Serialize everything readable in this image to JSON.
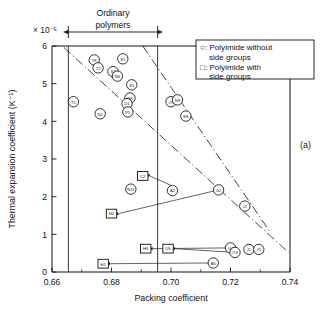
{
  "figure": {
    "panel_label": "(a)",
    "exponent_label": "× 10⁻⁵",
    "bracket_label_line1": "Ordinary",
    "bracket_label_line2": "polymers"
  },
  "legend": {
    "entries": [
      {
        "marker": "circle",
        "line1": "○: Polyimide without",
        "line2": "side groups"
      },
      {
        "marker": "square",
        "line1": "□: Polyimide with",
        "line2": "side groups"
      }
    ]
  },
  "chart_data": {
    "type": "scatter",
    "title": "",
    "xlabel": "Packing coefficient",
    "ylabel": "Thermal expansion coefficient (K⁻¹)",
    "y_exponent": "× 10⁻⁵",
    "xlim": [
      0.66,
      0.74
    ],
    "ylim": [
      0,
      6
    ],
    "xticks": [
      0.66,
      0.68,
      0.7,
      0.72,
      0.74
    ],
    "xtick_labels": [
      "0.66",
      "0.68",
      "0.70",
      "0.72",
      "0.74"
    ],
    "x_minor_ticks": [
      0.67,
      0.69,
      0.71,
      0.73
    ],
    "yticks": [
      0,
      1,
      2,
      3,
      4,
      5,
      6
    ],
    "ytick_labels": [
      "0",
      "1",
      "2",
      "3",
      "4",
      "5",
      "6"
    ],
    "grid": false,
    "legend_position": "top-right",
    "vertical_reference_lines": [
      0.6655,
      0.6955
    ],
    "annotation_bracket": {
      "label": "Ordinary polymers",
      "x_start": 0.6655,
      "x_end": 0.6955
    },
    "series": [
      {
        "name": "Polyimide without side groups",
        "marker": "circle",
        "points": [
          {
            "label": "T8",
            "x": 0.6742,
            "y": 5.63
          },
          {
            "label": "T2",
            "x": 0.6755,
            "y": 5.42
          },
          {
            "label": "S5",
            "x": 0.6838,
            "y": 5.66
          },
          {
            "label": "S2",
            "x": 0.6805,
            "y": 5.32
          },
          {
            "label": "N6",
            "x": 0.682,
            "y": 5.2
          },
          {
            "label": "S1",
            "x": 0.6868,
            "y": 4.97
          },
          {
            "label": "N8",
            "x": 0.6862,
            "y": 4.62
          },
          {
            "label": "D1",
            "x": 0.6852,
            "y": 4.47
          },
          {
            "label": "P5",
            "x": 0.6855,
            "y": 4.25
          },
          {
            "label": "T5",
            "x": 0.6672,
            "y": 4.52
          },
          {
            "label": "N1",
            "x": 0.6762,
            "y": 4.2
          },
          {
            "label": "O5",
            "x": 0.7,
            "y": 4.52
          },
          {
            "label": "N9",
            "x": 0.7022,
            "y": 4.57
          },
          {
            "label": "E8",
            "x": 0.705,
            "y": 4.14
          },
          {
            "label": "N11",
            "x": 0.6865,
            "y": 2.2
          },
          {
            "label": "A2",
            "x": 0.7005,
            "y": 2.16
          },
          {
            "label": "G2",
            "x": 0.716,
            "y": 2.18
          },
          {
            "label": "J2",
            "x": 0.7248,
            "y": 1.75
          },
          {
            "label": "G1",
            "x": 0.72,
            "y": 0.64
          },
          {
            "label": "O3",
            "x": 0.7215,
            "y": 0.52
          },
          {
            "label": "J1",
            "x": 0.7262,
            "y": 0.6
          },
          {
            "label": "J5",
            "x": 0.7295,
            "y": 0.6
          },
          {
            "label": "A6",
            "x": 0.7142,
            "y": 0.24
          }
        ]
      },
      {
        "name": "Polyimide with side groups",
        "marker": "square",
        "points": [
          {
            "label": "C2",
            "x": 0.6905,
            "y": 2.55
          },
          {
            "label": "H2",
            "x": 0.68,
            "y": 1.55
          },
          {
            "label": "H5",
            "x": 0.6915,
            "y": 0.62
          },
          {
            "label": "D5",
            "x": 0.699,
            "y": 0.62
          },
          {
            "label": "H1",
            "x": 0.6772,
            "y": 0.22
          }
        ]
      }
    ],
    "trend_lines": [
      {
        "name": "upper-trend",
        "x1": 0.664,
        "y1": 5.96,
        "x2": 0.7395,
        "y2": 0.52
      },
      {
        "name": "lower-trend",
        "x1": 0.6905,
        "y1": 6.0,
        "x2": 0.733,
        "y2": 1.1
      }
    ],
    "leader_lines": [
      {
        "from_label": "C2",
        "to_x": 0.7,
        "to_y": 2.3
      },
      {
        "from_label": "H2",
        "to_x": 0.716,
        "to_y": 2.18
      },
      {
        "from_label": "H5",
        "to_x": 0.72,
        "to_y": 0.64
      },
      {
        "from_label": "D5",
        "to_x": 0.7215,
        "to_y": 0.52
      },
      {
        "from_label": "H1",
        "to_x": 0.7142,
        "to_y": 0.24
      }
    ]
  }
}
